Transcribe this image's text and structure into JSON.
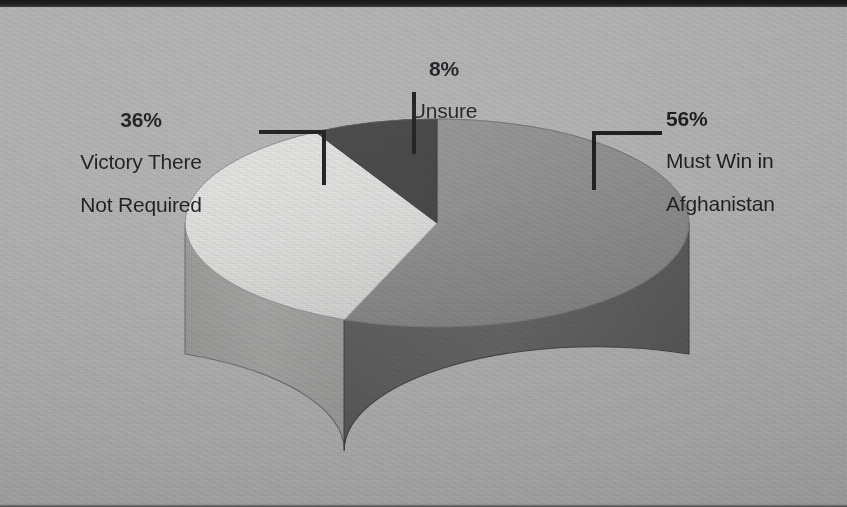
{
  "page": {
    "background_color": "#b3b3b3",
    "media": "scanned-print-page"
  },
  "chart_data": {
    "type": "pie",
    "title": "",
    "subtitle": "",
    "xlabel": "",
    "ylabel": "",
    "style": "3d-cylinder-pie",
    "legend_position": "callout-labels",
    "grid": false,
    "categories": [
      "Must Win in Afghanistan",
      "Victory There Not Required",
      "Unsure"
    ],
    "values": [
      56,
      36,
      8
    ],
    "value_suffix": "%",
    "slices": [
      {
        "label": "Must Win in\nAfghanistan",
        "label_line1": "Must Win in",
        "label_line2": "Afghanistan",
        "percent": "56%",
        "value": 56,
        "top_color": "#8a8a8a",
        "side_color": "#5c5c5c"
      },
      {
        "label": "Victory There\nNot Required",
        "label_line1": "Victory There",
        "label_line2": "Not Required",
        "percent": "36%",
        "value": 36,
        "top_color": "#e2e2e0",
        "side_color": "#a2a2a0"
      },
      {
        "label": "Unsure",
        "label_line1": "Unsure",
        "label_line2": "",
        "percent": "8%",
        "value": 8,
        "top_color": "#3b3b3b",
        "side_color": "#2b2b2b"
      }
    ]
  },
  "callouts": {
    "unsure": {
      "percent": "8%",
      "line1": "Unsure",
      "line2": ""
    },
    "victory": {
      "percent": "36%",
      "line1": "Victory There",
      "line2": "Not Required"
    },
    "must_win": {
      "percent": "56%",
      "line1": "Must Win in",
      "line2": "Afghanistan"
    }
  },
  "colors": {
    "leader_line": "#121316",
    "text": "#15161a",
    "background": "#b3b3b3",
    "slice_must_win_top": "#8a8a8a",
    "slice_must_win_side": "#5c5c5c",
    "slice_victory_top": "#e2e2e0",
    "slice_victory_side": "#a2a2a0",
    "slice_unsure_top": "#3b3b3b",
    "slice_unsure_side": "#2b2b2b"
  }
}
